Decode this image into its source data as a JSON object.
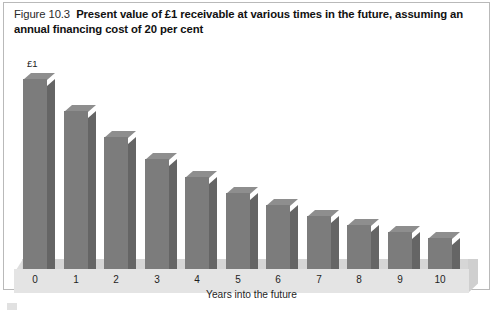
{
  "figure": {
    "number": "Figure 10.3",
    "caption": "Present value of £1 receivable at various times in the future, assuming an annual financing cost of 20 per cent"
  },
  "colors": {
    "bar_front": "#7c7c7c",
    "bar_side": "#656565",
    "bar_top": "#8e8e8e",
    "floor_front": "#e4e4e4",
    "floor_top": "#d6d6d6",
    "frame_border": "#b9b9b9"
  },
  "chart_data": {
    "type": "bar",
    "title": "Present value of £1 receivable at various times in the future, assuming an annual financing cost of 20 per cent",
    "xlabel": "Years into the future",
    "ylabel": "",
    "categories": [
      "0",
      "1",
      "2",
      "3",
      "4",
      "5",
      "6",
      "7",
      "8",
      "9",
      "10"
    ],
    "values": [
      1.0,
      0.833,
      0.694,
      0.579,
      0.482,
      0.402,
      0.335,
      0.279,
      0.233,
      0.194,
      0.162
    ],
    "value_labels": [
      "£1",
      "",
      "",
      "",
      "",
      "",
      "",
      "",
      "",
      "",
      ""
    ],
    "ylim": [
      0,
      1.0
    ],
    "grid": false,
    "legend": false,
    "style_3d": true,
    "annotations": [
      "£1"
    ]
  }
}
